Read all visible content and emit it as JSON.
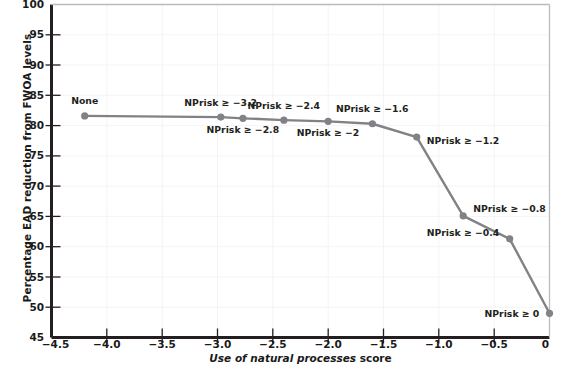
{
  "chart_data": {
    "type": "line",
    "title": "",
    "xlabel": "Use of natural processes score",
    "ylabel": "Percentage EAD reduction from FWOA levels",
    "xlim": [
      -4.5,
      0
    ],
    "ylim": [
      45,
      100
    ],
    "xticks": [
      "-4.5",
      "-4.0",
      "-3.5",
      "-3.0",
      "-2.5",
      "-2.0",
      "-1.5",
      "-1.0",
      "-0.5",
      "0"
    ],
    "xtick_values": [
      -4.5,
      -4.0,
      -3.5,
      -3.0,
      -2.5,
      -2.0,
      -1.5,
      -1.0,
      -0.5,
      0
    ],
    "yticks": [
      "45",
      "50",
      "55",
      "60",
      "65",
      "70",
      "75",
      "80",
      "85",
      "90",
      "95",
      "100"
    ],
    "ytick_values": [
      45,
      50,
      55,
      60,
      65,
      70,
      75,
      80,
      85,
      90,
      95,
      100
    ],
    "grid": true,
    "legend": "none",
    "line_color": "#808285",
    "marker_color": "#808285",
    "series": [
      {
        "name": "EAD reduction",
        "x": [
          -4.2,
          -2.97,
          -2.77,
          -2.4,
          -2.0,
          -1.6,
          -1.2,
          -0.78,
          -0.36,
          0.0
        ],
        "y": [
          81.6,
          81.4,
          81.2,
          80.9,
          80.7,
          80.3,
          78.1,
          65.1,
          61.3,
          49.0
        ]
      }
    ],
    "point_labels": [
      {
        "text": "None",
        "x": -4.2,
        "y": 81.6,
        "position": "above"
      },
      {
        "text": "NPrisk ≥ −3.2",
        "x": -2.97,
        "y": 81.4,
        "position": "above"
      },
      {
        "text": "NPrisk ≥ −2.8",
        "x": -2.77,
        "y": 81.2,
        "position": "below"
      },
      {
        "text": "NPrisk ≥ −2.4",
        "x": -2.4,
        "y": 80.9,
        "position": "above"
      },
      {
        "text": "NPrisk ≥ −2",
        "x": -2.0,
        "y": 80.7,
        "position": "below"
      },
      {
        "text": "NPrisk ≥ −1.6",
        "x": -1.6,
        "y": 80.3,
        "position": "above"
      },
      {
        "text": "NPrisk ≥ −1.2",
        "x": -1.2,
        "y": 78.1,
        "position": "right-below"
      },
      {
        "text": "NPrisk ≥ −0.8",
        "x": -0.78,
        "y": 65.1,
        "position": "right-above"
      },
      {
        "text": "NPrisk ≥ −0.4",
        "x": -0.36,
        "y": 61.3,
        "position": "left-above"
      },
      {
        "text": "NPrisk ≥ 0",
        "x": 0.0,
        "y": 49.0,
        "position": "left"
      }
    ]
  },
  "axis": {
    "xlabel_italic": "Use of natural processes",
    "xlabel_tail": " score",
    "ylabel": "Percentage EAD reduction from FWOA levels"
  },
  "labels": {
    "y0": "45",
    "y1": "50",
    "y2": "55",
    "y3": "60",
    "y4": "65",
    "y5": "70",
    "y6": "75",
    "y7": "80",
    "y8": "85",
    "y9": "90",
    "y10": "95",
    "y11": "100",
    "x0": "−4.5",
    "x1": "−4.0",
    "x2": "−3.5",
    "x3": "−3.0",
    "x4": "−2.5",
    "x5": "−2.0",
    "x6": "−1.5",
    "x7": "−1.0",
    "x8": "−0.5",
    "x9": "0",
    "p0": "None",
    "p1": "NPrisk ≥ −3.2",
    "p2": "NPrisk ≥ −2.8",
    "p3": "NPrisk ≥ −2.4",
    "p4": "NPrisk ≥ −2",
    "p5": "NPrisk ≥ −1.6",
    "p6": "NPrisk ≥ −1.2",
    "p7": "NPrisk ≥ −0.8",
    "p8": "NPrisk ≥ −0.4",
    "p9": "NPrisk ≥ 0"
  }
}
